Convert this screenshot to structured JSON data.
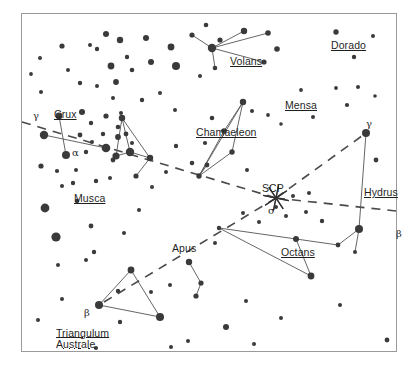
{
  "chart": {
    "type": "star-chart",
    "background_color": "#ffffff",
    "border_color": "#9a9a9a",
    "star_color": "#3a3a3a",
    "line_color": "#555555",
    "dash_color": "#4a4a4a",
    "frame": {
      "x": 21,
      "y": 13,
      "width": 376,
      "height": 339
    }
  },
  "pole_marker": {
    "name": "SCP",
    "label": "SCP",
    "label_x": 262,
    "label_y": 182,
    "x": 276,
    "y": 198,
    "rays": 8,
    "ray_length": 13
  },
  "constellation_labels": [
    {
      "name": "crux",
      "text": "Crux",
      "x": 54,
      "y": 108,
      "underline": true,
      "two_line": false
    },
    {
      "name": "musca",
      "text": "Musca",
      "x": 74,
      "y": 192,
      "underline": true,
      "two_line": false
    },
    {
      "name": "volans",
      "text": "Volans",
      "x": 230,
      "y": 55,
      "underline": true,
      "two_line": false
    },
    {
      "name": "dorado",
      "text": "Dorado",
      "x": 331,
      "y": 39,
      "underline": true,
      "two_line": false
    },
    {
      "name": "mensa",
      "text": "Mensa",
      "x": 285,
      "y": 99,
      "underline": true,
      "two_line": false
    },
    {
      "name": "chamaeleon",
      "text": "Chamaeleon",
      "x": 196,
      "y": 126,
      "underline": true,
      "two_line": false
    },
    {
      "name": "hydrus",
      "text": "Hydrus",
      "x": 364,
      "y": 186,
      "underline": true,
      "two_line": false
    },
    {
      "name": "octans",
      "text": "Octans",
      "x": 281,
      "y": 246,
      "underline": true,
      "two_line": false
    },
    {
      "name": "apus",
      "text": "Apus",
      "x": 172,
      "y": 242,
      "underline": false,
      "two_line": false
    },
    {
      "name": "triangulum-australe",
      "text": "Triangulum Australe",
      "x": 56,
      "y": 328,
      "underline": true,
      "two_line": true,
      "line1": "Triangulum",
      "line2": "Australe"
    }
  ],
  "star_labels": [
    {
      "name": "crux-gamma",
      "text": "γ",
      "x": 33,
      "y": 110
    },
    {
      "name": "crux-alpha",
      "text": "α",
      "x": 72,
      "y": 147
    },
    {
      "name": "hydrus-gamma",
      "text": "γ",
      "x": 366,
      "y": 118
    },
    {
      "name": "hydrus-beta",
      "text": "β",
      "x": 396,
      "y": 228
    },
    {
      "name": "octans-sigma",
      "text": "σ",
      "x": 268,
      "y": 205
    },
    {
      "name": "tra-beta",
      "text": "β",
      "x": 84,
      "y": 307
    }
  ],
  "stars": [
    {
      "x": 106,
      "y": 34,
      "r": 3.0
    },
    {
      "x": 120,
      "y": 40,
      "r": 3.2
    },
    {
      "x": 97,
      "y": 49,
      "r": 2.2
    },
    {
      "x": 127,
      "y": 57,
      "r": 2.2
    },
    {
      "x": 146,
      "y": 38,
      "r": 3.0
    },
    {
      "x": 111,
      "y": 66,
      "r": 3.4
    },
    {
      "x": 132,
      "y": 70,
      "r": 2.3
    },
    {
      "x": 151,
      "y": 62,
      "r": 3.0
    },
    {
      "x": 171,
      "y": 47,
      "r": 3.4
    },
    {
      "x": 176,
      "y": 66,
      "r": 4.0
    },
    {
      "x": 90,
      "y": 45,
      "r": 2.0
    },
    {
      "x": 62,
      "y": 46,
      "r": 2.6
    },
    {
      "x": 40,
      "y": 58,
      "r": 2.0
    },
    {
      "x": 80,
      "y": 83,
      "r": 2.2
    },
    {
      "x": 97,
      "y": 86,
      "r": 2.0
    },
    {
      "x": 116,
      "y": 82,
      "r": 2.9
    },
    {
      "x": 113,
      "y": 98,
      "r": 2.0
    },
    {
      "x": 68,
      "y": 70,
      "r": 2.0
    },
    {
      "x": 192,
      "y": 35,
      "r": 2.6
    },
    {
      "x": 206,
      "y": 25,
      "r": 2.3
    },
    {
      "x": 244,
      "y": 31,
      "r": 3.2
    },
    {
      "x": 268,
      "y": 33,
      "r": 2.8
    },
    {
      "x": 220,
      "y": 40,
      "r": 2.6
    },
    {
      "x": 277,
      "y": 49,
      "r": 2.8
    },
    {
      "x": 264,
      "y": 62,
      "r": 2.6
    },
    {
      "x": 215,
      "y": 68,
      "r": 2.3
    },
    {
      "x": 212,
      "y": 48,
      "r": 4.2
    },
    {
      "x": 200,
      "y": 76,
      "r": 2.0
    },
    {
      "x": 336,
      "y": 32,
      "r": 2.7
    },
    {
      "x": 373,
      "y": 36,
      "r": 2.0
    },
    {
      "x": 354,
      "y": 57,
      "r": 2.2
    },
    {
      "x": 301,
      "y": 90,
      "r": 1.9
    },
    {
      "x": 336,
      "y": 88,
      "r": 1.9
    },
    {
      "x": 358,
      "y": 87,
      "r": 2.0
    },
    {
      "x": 347,
      "y": 105,
      "r": 2.1
    },
    {
      "x": 375,
      "y": 96,
      "r": 1.8
    },
    {
      "x": 268,
      "y": 115,
      "r": 1.9
    },
    {
      "x": 281,
      "y": 124,
      "r": 1.8
    },
    {
      "x": 313,
      "y": 117,
      "r": 2.0
    },
    {
      "x": 252,
      "y": 111,
      "r": 2.0
    },
    {
      "x": 59,
      "y": 116,
      "r": 3.4
    },
    {
      "x": 82,
      "y": 112,
      "r": 3.0
    },
    {
      "x": 44,
      "y": 135,
      "r": 4.2
    },
    {
      "x": 80,
      "y": 135,
      "r": 2.4
    },
    {
      "x": 66,
      "y": 155,
      "r": 4.0
    },
    {
      "x": 91,
      "y": 123,
      "r": 2.2
    },
    {
      "x": 106,
      "y": 116,
      "r": 2.6
    },
    {
      "x": 118,
      "y": 127,
      "r": 2.3
    },
    {
      "x": 103,
      "y": 134,
      "r": 2.2
    },
    {
      "x": 121,
      "y": 113,
      "r": 2.0
    },
    {
      "x": 92,
      "y": 142,
      "r": 2.0
    },
    {
      "x": 106,
      "y": 148,
      "r": 4.3
    },
    {
      "x": 118,
      "y": 137,
      "r": 2.9
    },
    {
      "x": 132,
      "y": 143,
      "r": 2.0
    },
    {
      "x": 86,
      "y": 152,
      "r": 2.2
    },
    {
      "x": 41,
      "y": 166,
      "r": 2.6
    },
    {
      "x": 57,
      "y": 171,
      "r": 2.1
    },
    {
      "x": 76,
      "y": 170,
      "r": 2.0
    },
    {
      "x": 122,
      "y": 118,
      "r": 3.2
    },
    {
      "x": 126,
      "y": 134,
      "r": 2.4
    },
    {
      "x": 116,
      "y": 156,
      "r": 3.6
    },
    {
      "x": 130,
      "y": 152,
      "r": 4.2
    },
    {
      "x": 150,
      "y": 158,
      "r": 3.2
    },
    {
      "x": 136,
      "y": 176,
      "r": 2.6
    },
    {
      "x": 113,
      "y": 160,
      "r": 2.4
    },
    {
      "x": 62,
      "y": 186,
      "r": 2.0
    },
    {
      "x": 73,
      "y": 183,
      "r": 2.2
    },
    {
      "x": 96,
      "y": 181,
      "r": 2.2
    },
    {
      "x": 110,
      "y": 178,
      "r": 2.0
    },
    {
      "x": 176,
      "y": 146,
      "r": 2.2
    },
    {
      "x": 192,
      "y": 163,
      "r": 2.3
    },
    {
      "x": 166,
      "y": 172,
      "r": 2.0
    },
    {
      "x": 205,
      "y": 143,
      "r": 2.1
    },
    {
      "x": 243,
      "y": 102,
      "r": 3.2
    },
    {
      "x": 224,
      "y": 131,
      "r": 2.8
    },
    {
      "x": 232,
      "y": 152,
      "r": 2.7
    },
    {
      "x": 207,
      "y": 165,
      "r": 2.4
    },
    {
      "x": 199,
      "y": 176,
      "r": 2.7
    },
    {
      "x": 247,
      "y": 170,
      "r": 2.0
    },
    {
      "x": 212,
      "y": 118,
      "r": 2.3
    },
    {
      "x": 45,
      "y": 208,
      "r": 4.4
    },
    {
      "x": 77,
      "y": 201,
      "r": 2.2
    },
    {
      "x": 56,
      "y": 237,
      "r": 4.6
    },
    {
      "x": 91,
      "y": 226,
      "r": 2.4
    },
    {
      "x": 94,
      "y": 252,
      "r": 2.2
    },
    {
      "x": 58,
      "y": 265,
      "r": 2.0
    },
    {
      "x": 139,
      "y": 210,
      "r": 2.0
    },
    {
      "x": 124,
      "y": 233,
      "r": 2.0
    },
    {
      "x": 131,
      "y": 270,
      "r": 3.4
    },
    {
      "x": 118,
      "y": 291,
      "r": 2.2
    },
    {
      "x": 99,
      "y": 305,
      "r": 4.0
    },
    {
      "x": 160,
      "y": 317,
      "r": 4.0
    },
    {
      "x": 120,
      "y": 322,
      "r": 2.2
    },
    {
      "x": 62,
      "y": 299,
      "r": 2.0
    },
    {
      "x": 151,
      "y": 292,
      "r": 2.0
    },
    {
      "x": 189,
      "y": 262,
      "r": 3.2
    },
    {
      "x": 201,
      "y": 283,
      "r": 2.6
    },
    {
      "x": 196,
      "y": 296,
      "r": 2.6
    },
    {
      "x": 170,
      "y": 285,
      "r": 2.0
    },
    {
      "x": 215,
      "y": 243,
      "r": 2.0
    },
    {
      "x": 219,
      "y": 228,
      "r": 2.2
    },
    {
      "x": 243,
      "y": 213,
      "r": 2.0
    },
    {
      "x": 259,
      "y": 222,
      "r": 2.0
    },
    {
      "x": 286,
      "y": 216,
      "r": 2.0
    },
    {
      "x": 306,
      "y": 212,
      "r": 2.0
    },
    {
      "x": 322,
      "y": 221,
      "r": 2.2
    },
    {
      "x": 276,
      "y": 207,
      "r": 2.0
    },
    {
      "x": 293,
      "y": 196,
      "r": 2.0
    },
    {
      "x": 309,
      "y": 193,
      "r": 2.0
    },
    {
      "x": 296,
      "y": 239,
      "r": 3.0
    },
    {
      "x": 338,
      "y": 245,
      "r": 2.4
    },
    {
      "x": 311,
      "y": 276,
      "r": 3.4
    },
    {
      "x": 359,
      "y": 229,
      "r": 4.0
    },
    {
      "x": 355,
      "y": 252,
      "r": 2.0
    },
    {
      "x": 366,
      "y": 133,
      "r": 4.0
    },
    {
      "x": 376,
      "y": 160,
      "r": 2.4
    },
    {
      "x": 226,
      "y": 327,
      "r": 3.0
    },
    {
      "x": 188,
      "y": 341,
      "r": 2.0
    },
    {
      "x": 254,
      "y": 344,
      "r": 2.0
    },
    {
      "x": 171,
      "y": 347,
      "r": 2.0
    },
    {
      "x": 281,
      "y": 318,
      "r": 2.0
    },
    {
      "x": 340,
      "y": 305,
      "r": 2.0
    },
    {
      "x": 387,
      "y": 340,
      "r": 2.4
    },
    {
      "x": 246,
      "y": 301,
      "r": 2.0
    },
    {
      "x": 41,
      "y": 92,
      "r": 2.0
    },
    {
      "x": 31,
      "y": 74,
      "r": 1.9
    },
    {
      "x": 160,
      "y": 93,
      "r": 2.0
    },
    {
      "x": 142,
      "y": 100,
      "r": 2.2
    },
    {
      "x": 175,
      "y": 110,
      "r": 2.0
    },
    {
      "x": 152,
      "y": 187,
      "r": 2.0
    },
    {
      "x": 86,
      "y": 260,
      "r": 2.0
    },
    {
      "x": 38,
      "y": 320,
      "r": 2.0
    },
    {
      "x": 96,
      "y": 348,
      "r": 2.0
    }
  ],
  "constellation_lines": [
    {
      "name": "crux",
      "segments": [
        [
          59,
          116,
          66,
          155
        ],
        [
          44,
          135,
          106,
          148
        ]
      ]
    },
    {
      "name": "musca",
      "segments": [
        [
          122,
          118,
          116,
          156
        ],
        [
          122,
          118,
          130,
          152
        ],
        [
          122,
          118,
          150,
          158
        ],
        [
          116,
          156,
          130,
          152
        ],
        [
          130,
          152,
          150,
          158
        ],
        [
          150,
          158,
          136,
          176
        ]
      ]
    },
    {
      "name": "volans",
      "segments": [
        [
          192,
          35,
          212,
          48
        ],
        [
          212,
          48,
          244,
          31
        ],
        [
          212,
          48,
          268,
          33
        ],
        [
          212,
          48,
          264,
          62
        ],
        [
          212,
          48,
          215,
          68
        ]
      ]
    },
    {
      "name": "chamaeleon",
      "segments": [
        [
          199,
          176,
          243,
          102
        ],
        [
          199,
          176,
          224,
          131
        ],
        [
          199,
          176,
          232,
          152
        ],
        [
          224,
          131,
          243,
          102
        ],
        [
          232,
          152,
          243,
          102
        ],
        [
          199,
          176,
          207,
          165
        ]
      ]
    },
    {
      "name": "hydrus",
      "segments": [
        [
          366,
          133,
          359,
          229
        ],
        [
          359,
          229,
          355,
          252
        ]
      ]
    },
    {
      "name": "octans",
      "segments": [
        [
          219,
          228,
          296,
          239
        ],
        [
          219,
          228,
          311,
          276
        ],
        [
          296,
          239,
          311,
          276
        ],
        [
          296,
          239,
          338,
          245
        ],
        [
          338,
          245,
          359,
          229
        ]
      ]
    },
    {
      "name": "apus",
      "segments": [
        [
          189,
          262,
          201,
          283
        ],
        [
          201,
          283,
          196,
          296
        ]
      ]
    },
    {
      "name": "triangulum-australe",
      "segments": [
        [
          131,
          270,
          99,
          305
        ],
        [
          131,
          270,
          160,
          317
        ],
        [
          99,
          305,
          160,
          317
        ]
      ]
    }
  ],
  "dashed_lines": [
    {
      "name": "dash-crux-to-scp",
      "points": [
        [
          22,
          122
        ],
        [
          276,
          198
        ]
      ]
    },
    {
      "name": "dash-scp-to-hydrus-gamma",
      "points": [
        [
          276,
          198
        ],
        [
          366,
          133
        ]
      ]
    },
    {
      "name": "dash-scp-to-east",
      "points": [
        [
          276,
          198
        ],
        [
          396,
          211
        ]
      ]
    },
    {
      "name": "dash-scp-to-tra",
      "points": [
        [
          276,
          198
        ],
        [
          99,
          305
        ]
      ]
    }
  ]
}
